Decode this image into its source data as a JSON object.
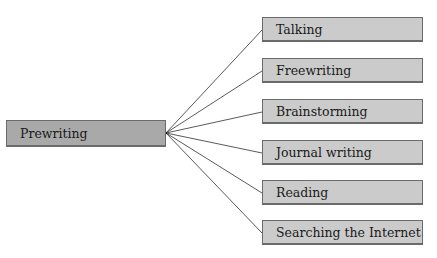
{
  "diagram": {
    "type": "mind-map",
    "root": {
      "label": "Prewriting"
    },
    "children": [
      {
        "label": "Talking"
      },
      {
        "label": "Freewriting"
      },
      {
        "label": "Brainstorming"
      },
      {
        "label": "Journal writing"
      },
      {
        "label": "Reading"
      },
      {
        "label": "Searching the Internet"
      }
    ],
    "colors": {
      "root_fill": "#a9a9a9",
      "child_fill": "#cbcbcb",
      "border": "#6a6a6a",
      "connector": "#5a5a5a"
    }
  }
}
